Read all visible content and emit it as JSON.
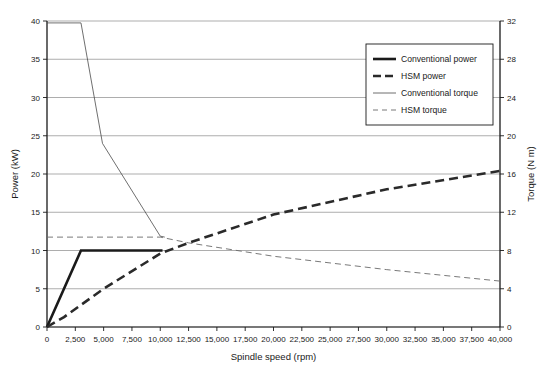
{
  "chart_data": {
    "type": "line",
    "title": "",
    "xlabel": "Spindle speed (rpm)",
    "ylabel": "Power (kW)",
    "y2label": "Torque (N m)",
    "xlim": [
      0,
      40000
    ],
    "ylim": [
      0,
      40
    ],
    "y2lim": [
      0,
      32
    ],
    "grid": true,
    "grid_axis": "y",
    "legend_position": "top-right",
    "xticks": [
      0,
      2500,
      5000,
      7500,
      10000,
      12500,
      15000,
      17500,
      20000,
      22500,
      25000,
      27500,
      30000,
      32500,
      35000,
      37500,
      40000
    ],
    "xtick_labels": [
      "0",
      "2,500",
      "5,000",
      "7,500",
      "10,000",
      "12,500",
      "15,000",
      "17,500",
      "20,000",
      "22,500",
      "25,000",
      "27,500",
      "30,000",
      "32,500",
      "35,000",
      "37,500",
      "40,000"
    ],
    "yticks": [
      0,
      5,
      10,
      15,
      20,
      25,
      30,
      35,
      40
    ],
    "ytick_labels": [
      "0",
      "5",
      "10",
      "15",
      "20",
      "25",
      "30",
      "35",
      "40"
    ],
    "y2ticks": [
      0,
      4,
      8,
      12,
      16,
      20,
      24,
      28,
      32
    ],
    "y2tick_labels": [
      "0",
      "4",
      "8",
      "12",
      "16",
      "20",
      "24",
      "28",
      "32"
    ],
    "series": [
      {
        "name": "Conventional power",
        "axis": "left",
        "unit": "kW",
        "style": "solid",
        "width": 2.6,
        "color": "#1a1a1a",
        "points": [
          [
            0,
            0
          ],
          [
            3000,
            10
          ],
          [
            10200,
            10
          ]
        ]
      },
      {
        "name": "HSM power",
        "axis": "left",
        "unit": "kW",
        "style": "dashed",
        "width": 2.6,
        "color": "#2a2a2a",
        "points": [
          [
            0,
            0
          ],
          [
            1500,
            1.3
          ],
          [
            5000,
            5.0
          ],
          [
            10000,
            9.6
          ],
          [
            12500,
            11.0
          ],
          [
            20000,
            14.7
          ],
          [
            30000,
            18.0
          ],
          [
            40000,
            20.4
          ]
        ]
      },
      {
        "name": "Conventional torque",
        "axis": "right",
        "unit": "N m",
        "style": "solid",
        "width": 0.8,
        "color": "#4a4a4a",
        "points": [
          [
            0,
            31.8
          ],
          [
            3000,
            31.8
          ],
          [
            4900,
            19.2
          ],
          [
            10000,
            9.5
          ],
          [
            10400,
            9.4
          ]
        ]
      },
      {
        "name": "HSM torque",
        "axis": "right",
        "unit": "N m",
        "style": "dashed",
        "width": 0.9,
        "color": "#6a6a6a",
        "points": [
          [
            0,
            9.4
          ],
          [
            10000,
            9.4
          ],
          [
            12500,
            8.8
          ],
          [
            20000,
            7.4
          ],
          [
            30000,
            6.0
          ],
          [
            40000,
            4.8
          ]
        ]
      }
    ],
    "legend_entries": [
      {
        "label": "Conventional power",
        "style": "solid",
        "width": 2.6,
        "color": "#1a1a1a"
      },
      {
        "label": "HSM power",
        "style": "dashed",
        "width": 2.6,
        "color": "#2a2a2a"
      },
      {
        "label": "Conventional torque",
        "style": "solid",
        "width": 0.8,
        "color": "#4a4a4a"
      },
      {
        "label": "HSM torque",
        "style": "dashed",
        "width": 0.9,
        "color": "#6a6a6a"
      }
    ],
    "colors": {
      "background": "#ffffff",
      "axis": "#1a1a1a",
      "grid": "#8a8a8a",
      "text": "#1a1a1a"
    }
  }
}
